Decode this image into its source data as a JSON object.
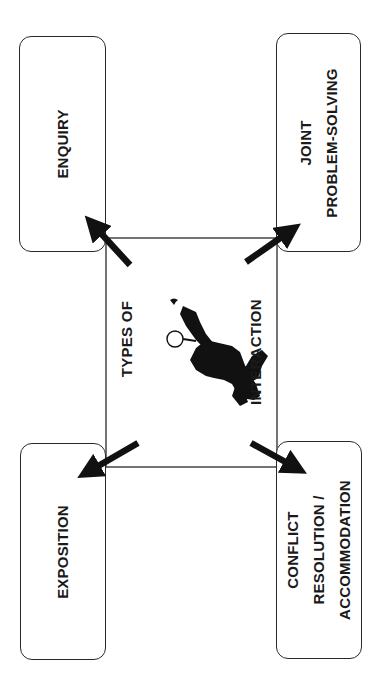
{
  "diagram": {
    "center": {
      "title_line1": "TYPES OF",
      "title_line2": "INTERACTION",
      "illustration": "silhouette-figure-icon"
    },
    "boxes": {
      "top_left": {
        "lines": [
          "ENQUIRY"
        ]
      },
      "top_right": {
        "lines": [
          "JOINT",
          "PROBLEM-SOLVING"
        ]
      },
      "bottom_left": {
        "lines": [
          "EXPOSITION"
        ]
      },
      "bottom_right": {
        "lines": [
          "CONFLICT",
          "RESOLUTION /",
          "ACCOMMODATION"
        ]
      }
    },
    "colors": {
      "ink": "#1a1a1a",
      "line": "#2a2a2a",
      "background": "#ffffff"
    },
    "orientation": "rotated -90deg (text reads bottom-to-top)"
  }
}
